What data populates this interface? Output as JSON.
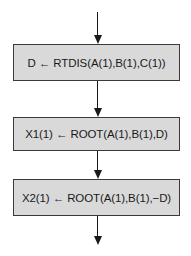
{
  "diagram": {
    "type": "flowchart",
    "direction": "top-to-bottom",
    "box_fill": "#d9d9d9",
    "stroke": "#1a1a1a",
    "boxes": [
      {
        "id": "b1",
        "label": "D ← RTDIS(A(1),B(1),C(1))"
      },
      {
        "id": "b2",
        "label": "X1(1) ← ROOT(A(1),B(1),D)"
      },
      {
        "id": "b3",
        "label": "X2(1) ← ROOT(A(1),B(1),−D)"
      }
    ],
    "edges": [
      {
        "from": "entry",
        "to": "b1"
      },
      {
        "from": "b1",
        "to": "b2"
      },
      {
        "from": "b2",
        "to": "b3"
      },
      {
        "from": "b3",
        "to": "exit"
      }
    ]
  }
}
